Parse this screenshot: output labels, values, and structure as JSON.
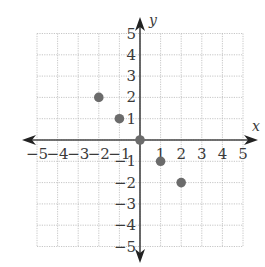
{
  "chart_data": {
    "type": "scatter",
    "title": "",
    "xlabel": "x",
    "ylabel": "y",
    "xlim": [
      -5,
      5
    ],
    "ylim": [
      -5,
      5
    ],
    "grid": true,
    "x_ticks": [
      -5,
      -4,
      -3,
      -2,
      -1,
      1,
      2,
      3,
      4,
      5
    ],
    "y_ticks": [
      -5,
      -4,
      -3,
      -2,
      -1,
      1,
      2,
      3,
      4,
      5
    ],
    "x_tick_labels": [
      "−5",
      "−4",
      "−3",
      "−2",
      "−1",
      "1",
      "2",
      "3",
      "4",
      "5"
    ],
    "y_tick_labels": [
      "−5",
      "−4",
      "−3",
      "−2",
      "−1",
      "1",
      "2",
      "3",
      "4",
      "5"
    ],
    "points": [
      {
        "x": -2,
        "y": 2
      },
      {
        "x": -1,
        "y": 1
      },
      {
        "x": 0,
        "y": 0
      },
      {
        "x": 1,
        "y": -1
      },
      {
        "x": 2,
        "y": -2
      }
    ],
    "point_color": "#6b6b6b"
  }
}
